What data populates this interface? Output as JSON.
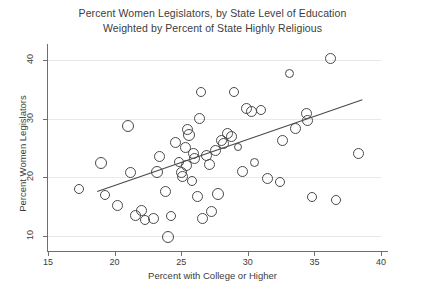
{
  "chart_data": {
    "type": "scatter",
    "title": "Percent Women Legislators, by State Level of Education",
    "subtitle": "Weighted by Percent of State Highly Religious",
    "xlabel": "Percent with College or Higher",
    "ylabel": "Percent Women Legislators",
    "xlim": [
      15,
      40
    ],
    "ylim": [
      8,
      42
    ],
    "xticks": [
      15,
      20,
      25,
      30,
      35,
      40
    ],
    "yticks": [
      10,
      20,
      30,
      40
    ],
    "grid": "horizontal",
    "legend": "none",
    "marker": "open-circle",
    "marker_color": "#4a4a4a",
    "points": [
      {
        "x": 17.3,
        "y": 18.0,
        "r": 5.0
      },
      {
        "x": 19.0,
        "y": 22.5,
        "r": 6.0
      },
      {
        "x": 19.3,
        "y": 17.0,
        "r": 5.0
      },
      {
        "x": 20.2,
        "y": 15.2,
        "r": 5.5
      },
      {
        "x": 21.0,
        "y": 28.8,
        "r": 6.0
      },
      {
        "x": 21.2,
        "y": 20.8,
        "r": 5.5
      },
      {
        "x": 21.6,
        "y": 13.6,
        "r": 5.5
      },
      {
        "x": 22.0,
        "y": 14.4,
        "r": 5.5
      },
      {
        "x": 22.3,
        "y": 12.7,
        "r": 5.0
      },
      {
        "x": 22.9,
        "y": 13.0,
        "r": 5.5
      },
      {
        "x": 23.2,
        "y": 21.0,
        "r": 6.0
      },
      {
        "x": 23.4,
        "y": 23.6,
        "r": 5.5
      },
      {
        "x": 23.8,
        "y": 17.6,
        "r": 5.5
      },
      {
        "x": 24.0,
        "y": 9.8,
        "r": 6.0
      },
      {
        "x": 24.2,
        "y": 13.4,
        "r": 5.0
      },
      {
        "x": 24.6,
        "y": 26.0,
        "r": 5.5
      },
      {
        "x": 24.8,
        "y": 22.6,
        "r": 5.0
      },
      {
        "x": 25.0,
        "y": 20.9,
        "r": 5.5
      },
      {
        "x": 25.1,
        "y": 20.2,
        "r": 5.5
      },
      {
        "x": 25.3,
        "y": 25.1,
        "r": 5.5
      },
      {
        "x": 25.4,
        "y": 22.1,
        "r": 5.5
      },
      {
        "x": 25.5,
        "y": 28.2,
        "r": 5.5
      },
      {
        "x": 25.6,
        "y": 27.2,
        "r": 6.0
      },
      {
        "x": 25.8,
        "y": 19.4,
        "r": 5.0
      },
      {
        "x": 25.9,
        "y": 24.0,
        "r": 5.5
      },
      {
        "x": 26.0,
        "y": 23.3,
        "r": 5.5
      },
      {
        "x": 26.2,
        "y": 16.7,
        "r": 5.5
      },
      {
        "x": 26.4,
        "y": 30.0,
        "r": 5.5
      },
      {
        "x": 26.5,
        "y": 34.5,
        "r": 5.0
      },
      {
        "x": 26.6,
        "y": 13.1,
        "r": 5.5
      },
      {
        "x": 26.9,
        "y": 23.7,
        "r": 5.5
      },
      {
        "x": 27.1,
        "y": 22.2,
        "r": 5.5
      },
      {
        "x": 27.3,
        "y": 14.2,
        "r": 5.5
      },
      {
        "x": 27.6,
        "y": 24.6,
        "r": 5.5
      },
      {
        "x": 27.8,
        "y": 17.2,
        "r": 6.0
      },
      {
        "x": 28.0,
        "y": 26.3,
        "r": 5.5
      },
      {
        "x": 28.2,
        "y": 25.7,
        "r": 5.5
      },
      {
        "x": 28.5,
        "y": 27.5,
        "r": 5.5
      },
      {
        "x": 28.8,
        "y": 27.0,
        "r": 5.5
      },
      {
        "x": 29.0,
        "y": 34.5,
        "r": 5.0
      },
      {
        "x": 29.3,
        "y": 25.2,
        "r": 4.0
      },
      {
        "x": 29.6,
        "y": 21.0,
        "r": 5.5
      },
      {
        "x": 29.9,
        "y": 31.8,
        "r": 5.5
      },
      {
        "x": 30.3,
        "y": 31.2,
        "r": 5.5
      },
      {
        "x": 30.5,
        "y": 22.6,
        "r": 4.5
      },
      {
        "x": 31.0,
        "y": 31.4,
        "r": 5.0
      },
      {
        "x": 31.5,
        "y": 19.9,
        "r": 5.5
      },
      {
        "x": 32.4,
        "y": 19.3,
        "r": 5.0
      },
      {
        "x": 32.6,
        "y": 26.2,
        "r": 5.5
      },
      {
        "x": 33.1,
        "y": 37.6,
        "r": 4.5
      },
      {
        "x": 33.6,
        "y": 28.3,
        "r": 5.5
      },
      {
        "x": 34.4,
        "y": 30.9,
        "r": 5.5
      },
      {
        "x": 34.5,
        "y": 29.6,
        "r": 5.5
      },
      {
        "x": 34.8,
        "y": 16.6,
        "r": 5.0
      },
      {
        "x": 36.2,
        "y": 40.3,
        "r": 5.5
      },
      {
        "x": 36.6,
        "y": 16.2,
        "r": 5.0
      },
      {
        "x": 38.3,
        "y": 24.0,
        "r": 5.5
      }
    ],
    "fit_line": {
      "x1": 18.7,
      "y1": 17.6,
      "x2": 38.6,
      "y2": 33.2,
      "color": "#4a4a4a"
    }
  }
}
